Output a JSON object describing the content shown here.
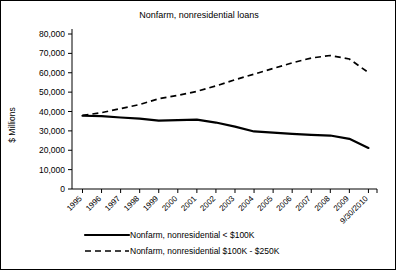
{
  "chart_data": {
    "type": "line",
    "title": "Nonfarm, nonresidential loans",
    "xlabel": "",
    "ylabel": "$ Millions",
    "ylim": [
      0,
      80000
    ],
    "ytick_labels": [
      "80,000",
      "70,000",
      "60,000",
      "50,000",
      "40,000",
      "30,000",
      "20,000",
      "10,000",
      "0"
    ],
    "ytick_values": [
      80000,
      70000,
      60000,
      50000,
      40000,
      30000,
      20000,
      10000,
      0
    ],
    "grid": false,
    "legend_position": "bottom",
    "categories": [
      "1995",
      "1996",
      "1997",
      "1998",
      "1999",
      "2000",
      "2001",
      "2002",
      "2003",
      "2004",
      "2005",
      "2006",
      "2007",
      "2008",
      "2009",
      "9/30/2010"
    ],
    "series": [
      {
        "name": "Nonfarm, nonresidential < $100K",
        "style": "solid",
        "values": [
          37800,
          37600,
          36900,
          36300,
          35300,
          35600,
          35800,
          34300,
          32200,
          29700,
          29100,
          28400,
          27900,
          27600,
          25900,
          21200
        ]
      },
      {
        "name": "Nonfarm, nonresidential $100K - $250K",
        "style": "dashed",
        "values": [
          38000,
          39400,
          41500,
          43600,
          46600,
          48300,
          50400,
          53200,
          56400,
          59300,
          62200,
          65100,
          67600,
          68900,
          67100,
          60100
        ]
      }
    ]
  },
  "legend": {
    "items": [
      {
        "label": "Nonfarm, nonresidential < $100K",
        "style": "solid"
      },
      {
        "label": "Nonfarm, nonresidential $100K - $250K",
        "style": "dashed"
      }
    ]
  }
}
